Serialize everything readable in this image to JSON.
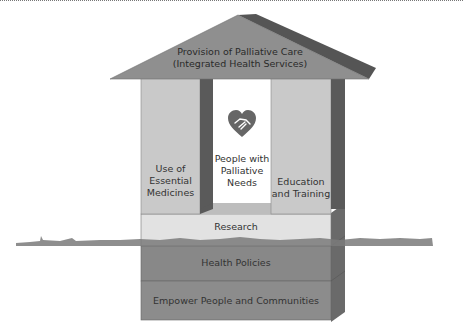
{
  "diagram": {
    "type": "house-framework",
    "roof": {
      "line1": "Provision of Palliative Care",
      "line2": "(Integrated Health Services)"
    },
    "pillars": [
      {
        "id": "left",
        "lines": [
          "Use of",
          "Essential",
          "Medicines"
        ]
      },
      {
        "id": "center",
        "lines": [
          "People with",
          "Palliative",
          "Needs"
        ],
        "icon": "heart-handshake-icon"
      },
      {
        "id": "right",
        "lines": [
          "Education",
          "and Training"
        ]
      }
    ],
    "foundation": [
      {
        "label": "Research"
      },
      {
        "label": "Health Policies"
      },
      {
        "label": "Empower People and Communities"
      }
    ],
    "colors": {
      "roof_front": "#8f8f8f",
      "roof_top": "#555555",
      "pillar_light": "#c9c9c9",
      "pillar_dark": "#5a5a5a",
      "center_bg": "#ffffff",
      "research": "#e2e2e2",
      "policies": "#888888",
      "empower": "#8c8c8c",
      "side_face": "#6a6a6a",
      "grass": "#7a7a7a"
    }
  }
}
